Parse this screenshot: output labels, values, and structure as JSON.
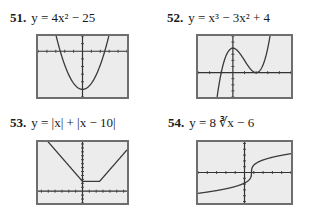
{
  "problems": [
    {
      "number": "51.",
      "equation": "y = 4x² − 25"
    },
    {
      "number": "52.",
      "equation": "y = x³ − 3x² + 4"
    },
    {
      "number": "53.",
      "equation": "y = |x| + |x − 10|"
    },
    {
      "number": "54.",
      "equation": "y = 8 ∛x − 6"
    }
  ],
  "chart_data": [
    {
      "type": "line",
      "title": "51. y = 4x^2 - 25",
      "function": "4x^2 - 25",
      "xlim": [
        -5,
        5
      ],
      "ylim": [
        -30,
        10
      ],
      "xtick_step": 1,
      "ytick_step": 5,
      "grid": false,
      "key_points": [
        [
          0,
          -25
        ],
        [
          -2.5,
          0
        ],
        [
          2.5,
          0
        ]
      ]
    },
    {
      "type": "line",
      "title": "52. y = x^3 - 3x^2 + 4",
      "function": "x^3 - 3x^2 + 4",
      "xlim": [
        -3,
        5
      ],
      "ylim": [
        -4,
        6
      ],
      "xtick_step": 1,
      "ytick_step": 1,
      "grid": false,
      "key_points": [
        [
          0,
          4
        ],
        [
          2,
          0
        ],
        [
          -1,
          0
        ]
      ]
    },
    {
      "type": "line",
      "title": "53. y = |x| + |x - 10|",
      "function": "|x| + |x - 10|",
      "xlim": [
        -26,
        26
      ],
      "ylim": [
        -12,
        50
      ],
      "xtick_step": 4,
      "ytick_step": 4,
      "grid": false,
      "key_points": [
        [
          0,
          10
        ],
        [
          10,
          10
        ]
      ]
    },
    {
      "type": "line",
      "title": "54. y = 8 cbrt(x - 6)",
      "function": "8*cbrt(x - 6)",
      "xlim": [
        -40,
        40
      ],
      "ylim": [
        -42,
        42
      ],
      "xtick_step": 8,
      "ytick_step": 8,
      "grid": false,
      "key_points": [
        [
          6,
          0
        ]
      ]
    }
  ]
}
